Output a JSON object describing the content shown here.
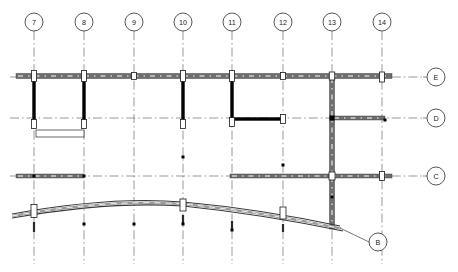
{
  "drawing": {
    "title": "structural-framing-plan",
    "type": "architectural-structural-plan",
    "canvas": {
      "width": 458,
      "height": 272
    },
    "colors": {
      "background": "#ffffff",
      "beam_fill": "#6e6e6e",
      "beam_light": "#9a9a9a",
      "wall_solid": "#000000",
      "gridline": "#555555",
      "column_fill": "#ffffff",
      "outline": "#1a1a1a",
      "leader": "#333333"
    }
  },
  "column_grids": {
    "label_prefix": "",
    "bubble_radius": 9,
    "bubble_cy": 22,
    "items": [
      {
        "label": "7",
        "x": 34,
        "line_bottom": 264
      },
      {
        "label": "8",
        "x": 84,
        "line_bottom": 264
      },
      {
        "label": "9",
        "x": 134,
        "line_bottom": 264
      },
      {
        "label": "10",
        "x": 183,
        "line_bottom": 264
      },
      {
        "label": "11",
        "x": 232,
        "line_bottom": 264
      },
      {
        "label": "12",
        "x": 283,
        "line_bottom": 264
      },
      {
        "label": "13",
        "x": 332,
        "line_bottom": 264
      },
      {
        "label": "14",
        "x": 382,
        "line_bottom": 264
      }
    ]
  },
  "row_grids": {
    "bubble_radius": 9,
    "bubble_cx": 436,
    "items": [
      {
        "label": "E",
        "y": 77,
        "line_left": 10,
        "line_right": 423
      },
      {
        "label": "D",
        "y": 118,
        "line_left": 10,
        "line_right": 423
      },
      {
        "label": "C",
        "y": 176,
        "line_left": 10,
        "line_right": 423
      }
    ]
  },
  "leader_bubbles": [
    {
      "label": "B",
      "cx": 378,
      "cy": 242,
      "radius": 9,
      "leader_from_x": 340,
      "leader_from_y": 228
    }
  ],
  "beams": [
    {
      "name": "beam-row-E-main",
      "x1": 16,
      "y1": 76,
      "x2": 392,
      "y2": 76,
      "thickness": 5,
      "orientation": "horizontal"
    },
    {
      "name": "beam-row-D-right",
      "x1": 332,
      "y1": 118,
      "x2": 385,
      "y2": 118,
      "thickness": 4,
      "orientation": "horizontal"
    },
    {
      "name": "beam-row-C-left",
      "x1": 16,
      "y1": 176,
      "x2": 84,
      "y2": 176,
      "thickness": 4,
      "orientation": "horizontal"
    },
    {
      "name": "beam-row-C-right",
      "x1": 230,
      "y1": 176,
      "x2": 392,
      "y2": 176,
      "thickness": 4,
      "orientation": "horizontal"
    },
    {
      "name": "beam-grid-13-vert",
      "x1": 332,
      "y1": 76,
      "x2": 332,
      "y2": 229,
      "thickness": 5,
      "orientation": "vertical"
    }
  ],
  "solid_walls": [
    {
      "name": "wall-grid-7",
      "x1": 34,
      "y1": 78,
      "x2": 34,
      "y2": 125,
      "thickness": 3.4
    },
    {
      "name": "wall-grid-8",
      "x1": 84,
      "y1": 78,
      "x2": 84,
      "y2": 125,
      "thickness": 3.4
    },
    {
      "name": "wall-grid-10",
      "x1": 183,
      "y1": 78,
      "x2": 183,
      "y2": 125,
      "thickness": 3.4
    },
    {
      "name": "wall-grid-11",
      "x1": 232,
      "y1": 78,
      "x2": 232,
      "y2": 120,
      "thickness": 3.4
    },
    {
      "name": "wall-11-to-12-spur",
      "x1": 231,
      "y1": 119,
      "x2": 284,
      "y2": 119,
      "thickness": 3.4
    }
  ],
  "columns": [
    {
      "name": "column-7-E",
      "cx": 34,
      "cy": 76,
      "w": 5,
      "h": 11
    },
    {
      "name": "column-8-E",
      "cx": 84,
      "cy": 76,
      "w": 5,
      "h": 11
    },
    {
      "name": "column-9-E",
      "cx": 134,
      "cy": 76,
      "w": 5,
      "h": 7
    },
    {
      "name": "column-10-E",
      "cx": 183,
      "cy": 76,
      "w": 5,
      "h": 11
    },
    {
      "name": "column-11-E",
      "cx": 232,
      "cy": 76,
      "w": 5,
      "h": 11
    },
    {
      "name": "column-12-E",
      "cx": 283,
      "cy": 76,
      "w": 5,
      "h": 7
    },
    {
      "name": "column-13-E",
      "cx": 332,
      "cy": 76,
      "w": 5.5,
      "h": 8
    },
    {
      "name": "column-14-E",
      "cx": 382,
      "cy": 77,
      "w": 5,
      "h": 10
    },
    {
      "name": "column-7-D",
      "cx": 34,
      "cy": 124,
      "w": 5,
      "h": 9
    },
    {
      "name": "column-8-D",
      "cx": 84,
      "cy": 124,
      "w": 5,
      "h": 9
    },
    {
      "name": "column-10-D",
      "cx": 183,
      "cy": 124,
      "w": 5,
      "h": 9
    },
    {
      "name": "column-11-D",
      "cx": 232,
      "cy": 122,
      "w": 5,
      "h": 9
    },
    {
      "name": "column-12-D",
      "cx": 283,
      "cy": 119,
      "w": 5,
      "h": 9
    },
    {
      "name": "column-13-C",
      "cx": 332,
      "cy": 176,
      "w": 6,
      "h": 8
    },
    {
      "name": "column-14-C",
      "cx": 382,
      "cy": 176,
      "w": 5,
      "h": 9
    },
    {
      "name": "column-7-B",
      "cx": 34,
      "cy": 211,
      "w": 6,
      "h": 13
    },
    {
      "name": "column-10-B",
      "cx": 183,
      "cy": 205,
      "w": 6,
      "h": 12
    },
    {
      "name": "column-12-B",
      "cx": 283,
      "cy": 213,
      "w": 6,
      "h": 12
    }
  ],
  "small_nodes": [
    {
      "name": "node-13-D",
      "cx": 332,
      "cy": 118,
      "size": 5
    },
    {
      "name": "node-14-D",
      "cx": 385,
      "cy": 120,
      "size": 3
    },
    {
      "name": "node-7-C",
      "cx": 34,
      "cy": 176,
      "size": 3
    },
    {
      "name": "node-8-C",
      "cx": 84,
      "cy": 176,
      "size": 3
    },
    {
      "name": "node-10-mid",
      "cx": 183,
      "cy": 157,
      "size": 3
    },
    {
      "name": "node-12-mid",
      "cx": 283,
      "cy": 165,
      "size": 3
    },
    {
      "name": "node-13-mid",
      "cx": 332,
      "cy": 197,
      "size": 3
    },
    {
      "name": "node-8-arch",
      "cx": 84,
      "cy": 224,
      "size": 3
    },
    {
      "name": "node-9-arch",
      "cx": 134,
      "cy": 224,
      "size": 3
    },
    {
      "name": "node-10-arch",
      "cx": 183,
      "cy": 224,
      "size": 3
    },
    {
      "name": "node-11-arch",
      "cx": 232,
      "cy": 230,
      "size": 3
    }
  ],
  "opening_rectangles": [
    {
      "name": "opening-7-to-8",
      "x": 36,
      "y": 130,
      "w": 48,
      "h": 7
    }
  ],
  "arch": {
    "name": "curved-roof-beam",
    "description": "curved arched beam spanning grids 7 through 13",
    "top_path": "M 12,214 Q 110,196 183,202 Q 260,209 340,226",
    "bottom_path": "M 12,218 Q 110,201 183,206 Q 260,214 343,231",
    "thickness": 4
  },
  "pin_stubs": [
    {
      "name": "pin-7-B",
      "x": 34,
      "y1": 222,
      "y2": 232
    },
    {
      "name": "pin-10-B",
      "x": 183,
      "y1": 215,
      "y2": 224
    },
    {
      "name": "pin-11-B",
      "x": 232,
      "y1": 221,
      "y2": 230
    },
    {
      "name": "pin-12-B",
      "x": 283,
      "y1": 224,
      "y2": 232
    }
  ]
}
